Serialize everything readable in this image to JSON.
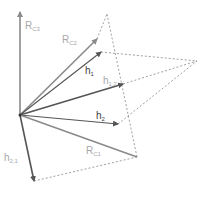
{
  "diagram": {
    "origin": [
      20,
      115
    ],
    "colors": {
      "arrow_dark": "#555555",
      "arrow_light": "#8a8a8a",
      "dashed": "#888888",
      "label_light": "#a8a8a8",
      "label_dark": "#404040"
    },
    "vectors": [
      {
        "id": "R_C3",
        "end": [
          20,
          12
        ],
        "style": "light"
      },
      {
        "id": "R_C2",
        "end": [
          97,
          39
        ],
        "style": "light"
      },
      {
        "id": "h1",
        "end": [
          101,
          52
        ],
        "style": "dark"
      },
      {
        "id": "h1,2",
        "end": [
          123,
          84
        ],
        "style": "dark"
      },
      {
        "id": "h2",
        "end": [
          118,
          124
        ],
        "style": "dark"
      },
      {
        "id": "R_C1",
        "end": [
          137,
          157
        ],
        "style": "light"
      },
      {
        "id": "h2,1",
        "end": [
          34,
          181
        ],
        "style": "dark"
      }
    ],
    "dashed_lines": [
      [
        [
          97,
          39
        ],
        [
          107,
          14
        ]
      ],
      [
        [
          107,
          14
        ],
        [
          137,
          157
        ]
      ],
      [
        [
          101,
          52
        ],
        [
          197,
          61
        ]
      ],
      [
        [
          123,
          84
        ],
        [
          197,
          61
        ]
      ],
      [
        [
          118,
          124
        ],
        [
          197,
          61
        ]
      ],
      [
        [
          34,
          181
        ],
        [
          137,
          157
        ]
      ]
    ],
    "labels": {
      "rc3": {
        "main": "R",
        "sub": "C3"
      },
      "rc2": {
        "main": "R",
        "sub": "C2"
      },
      "h1": {
        "main": "h",
        "sub": "1"
      },
      "h12": {
        "main": "h",
        "sub": "1,2"
      },
      "h2": {
        "main": "h",
        "sub": "2"
      },
      "rc1": {
        "main": "R",
        "sub": "C1"
      },
      "h21": {
        "main": "h",
        "sub": "2,1"
      }
    }
  }
}
